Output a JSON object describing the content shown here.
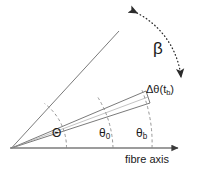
{
  "diagram": {
    "background_color": "#ffffff",
    "line_color": "#4d4d4d",
    "text_color": "#1a1a1a",
    "labels": {
      "beta": "β",
      "delta_theta": "Δθ(t",
      "delta_theta_sub": "b",
      "delta_theta_close": ")",
      "theta_capital": "Θ",
      "theta_zero": "θ",
      "theta_zero_sub": "0",
      "theta_b": "θ",
      "theta_b_sub": "b",
      "fibre_axis": "fibre axis"
    },
    "elements": {
      "vertex": "cone-apex",
      "axis_arrow": "fibre-axis-arrow",
      "rotation_arc": "beta-double-arrow-arc",
      "cone": "delta-theta-cone",
      "arcs": [
        "theta-capital-arc",
        "theta-zero-arc",
        "theta-b-arc"
      ],
      "rays": [
        "upper-ray",
        "cone-upper-edge",
        "cone-lower-edge"
      ]
    }
  }
}
